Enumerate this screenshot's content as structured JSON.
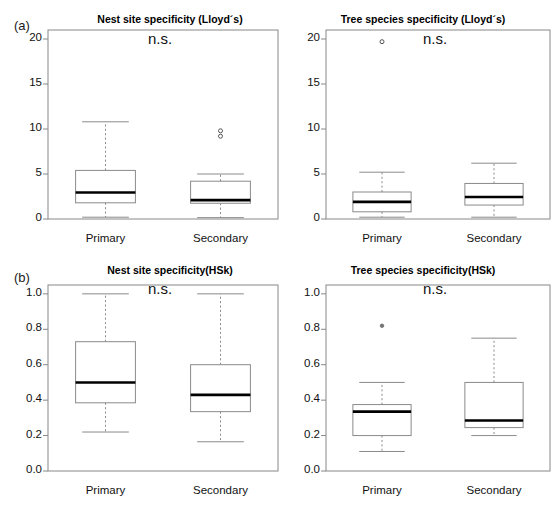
{
  "figure": {
    "panel_labels": [
      "(a)",
      "(b)"
    ],
    "significance_annotation": "n.s.",
    "category_labels": [
      "Primary",
      "Secondary"
    ]
  },
  "chart_data": [
    {
      "type": "box",
      "panel": "(a)",
      "position": "top-left",
      "title": "Nest site specificity (Lloyd´s)",
      "xlabel": "",
      "ylabel": "",
      "ylim": [
        0,
        21
      ],
      "yticks": [
        0,
        5,
        10,
        15,
        20
      ],
      "ytick_labels": [
        "0",
        "5",
        "10",
        "15",
        "20"
      ],
      "grid": false,
      "annotation": "n.s.",
      "categories": [
        "Primary",
        "Secondary"
      ],
      "boxes": [
        {
          "name": "Primary",
          "whisker_low": 0.2,
          "q1": 1.8,
          "median": 2.95,
          "q3": 5.4,
          "whisker_high": 10.8,
          "outliers": []
        },
        {
          "name": "Secondary",
          "whisker_low": 0.15,
          "q1": 1.75,
          "median": 2.1,
          "q3": 4.2,
          "whisker_high": 5.0,
          "outliers": [
            9.8,
            9.2
          ]
        }
      ]
    },
    {
      "type": "box",
      "panel": "(a)",
      "position": "top-right",
      "title": "Tree species specificity (Lloyd´s)",
      "xlabel": "",
      "ylabel": "",
      "ylim": [
        0,
        21
      ],
      "yticks": [
        0,
        5,
        10,
        15,
        20
      ],
      "ytick_labels": [
        "0",
        "5",
        "10",
        "15",
        "20"
      ],
      "grid": false,
      "annotation": "n.s.",
      "categories": [
        "Primary",
        "Secondary"
      ],
      "boxes": [
        {
          "name": "Primary",
          "whisker_low": 0.2,
          "q1": 0.8,
          "median": 1.9,
          "q3": 3.0,
          "whisker_high": 5.2,
          "outliers": [
            19.7
          ]
        },
        {
          "name": "Secondary",
          "whisker_low": 0.2,
          "q1": 1.55,
          "median": 2.45,
          "q3": 3.95,
          "whisker_high": 6.2,
          "outliers": []
        }
      ]
    },
    {
      "type": "box",
      "panel": "(b)",
      "position": "bottom-left",
      "title": "Nest site specificity(HSk)",
      "xlabel": "",
      "ylabel": "",
      "ylim": [
        0.0,
        1.05
      ],
      "yticks": [
        0.0,
        0.2,
        0.4,
        0.6,
        0.8,
        1.0
      ],
      "ytick_labels": [
        "0.0",
        "0.2",
        "0.4",
        "0.6",
        "0.8",
        "1.0"
      ],
      "grid": false,
      "annotation": "n.s.",
      "categories": [
        "Primary",
        "Secondary"
      ],
      "boxes": [
        {
          "name": "Primary",
          "whisker_low": 0.22,
          "q1": 0.385,
          "median": 0.5,
          "q3": 0.73,
          "whisker_high": 1.0,
          "outliers": []
        },
        {
          "name": "Secondary",
          "whisker_low": 0.165,
          "q1": 0.335,
          "median": 0.43,
          "q3": 0.6,
          "whisker_high": 1.0,
          "outliers": []
        }
      ]
    },
    {
      "type": "box",
      "panel": "(b)",
      "position": "bottom-right",
      "title": "Tree species specificity(HSk)",
      "xlabel": "",
      "ylabel": "",
      "ylim": [
        0.0,
        1.05
      ],
      "yticks": [
        0.0,
        0.2,
        0.4,
        0.6,
        0.8,
        1.0
      ],
      "ytick_labels": [
        "0.0",
        "0.2",
        "0.4",
        "0.6",
        "0.8",
        "1.0"
      ],
      "grid": false,
      "annotation": "n.s.",
      "categories": [
        "Primary",
        "Secondary"
      ],
      "boxes": [
        {
          "name": "Primary",
          "whisker_low": 0.11,
          "q1": 0.2,
          "median": 0.335,
          "q3": 0.375,
          "whisker_high": 0.5,
          "outliers": [
            0.82
          ]
        },
        {
          "name": "Secondary",
          "whisker_low": 0.2,
          "q1": 0.245,
          "median": 0.285,
          "q3": 0.5,
          "whisker_high": 0.75,
          "outliers": []
        }
      ]
    }
  ]
}
